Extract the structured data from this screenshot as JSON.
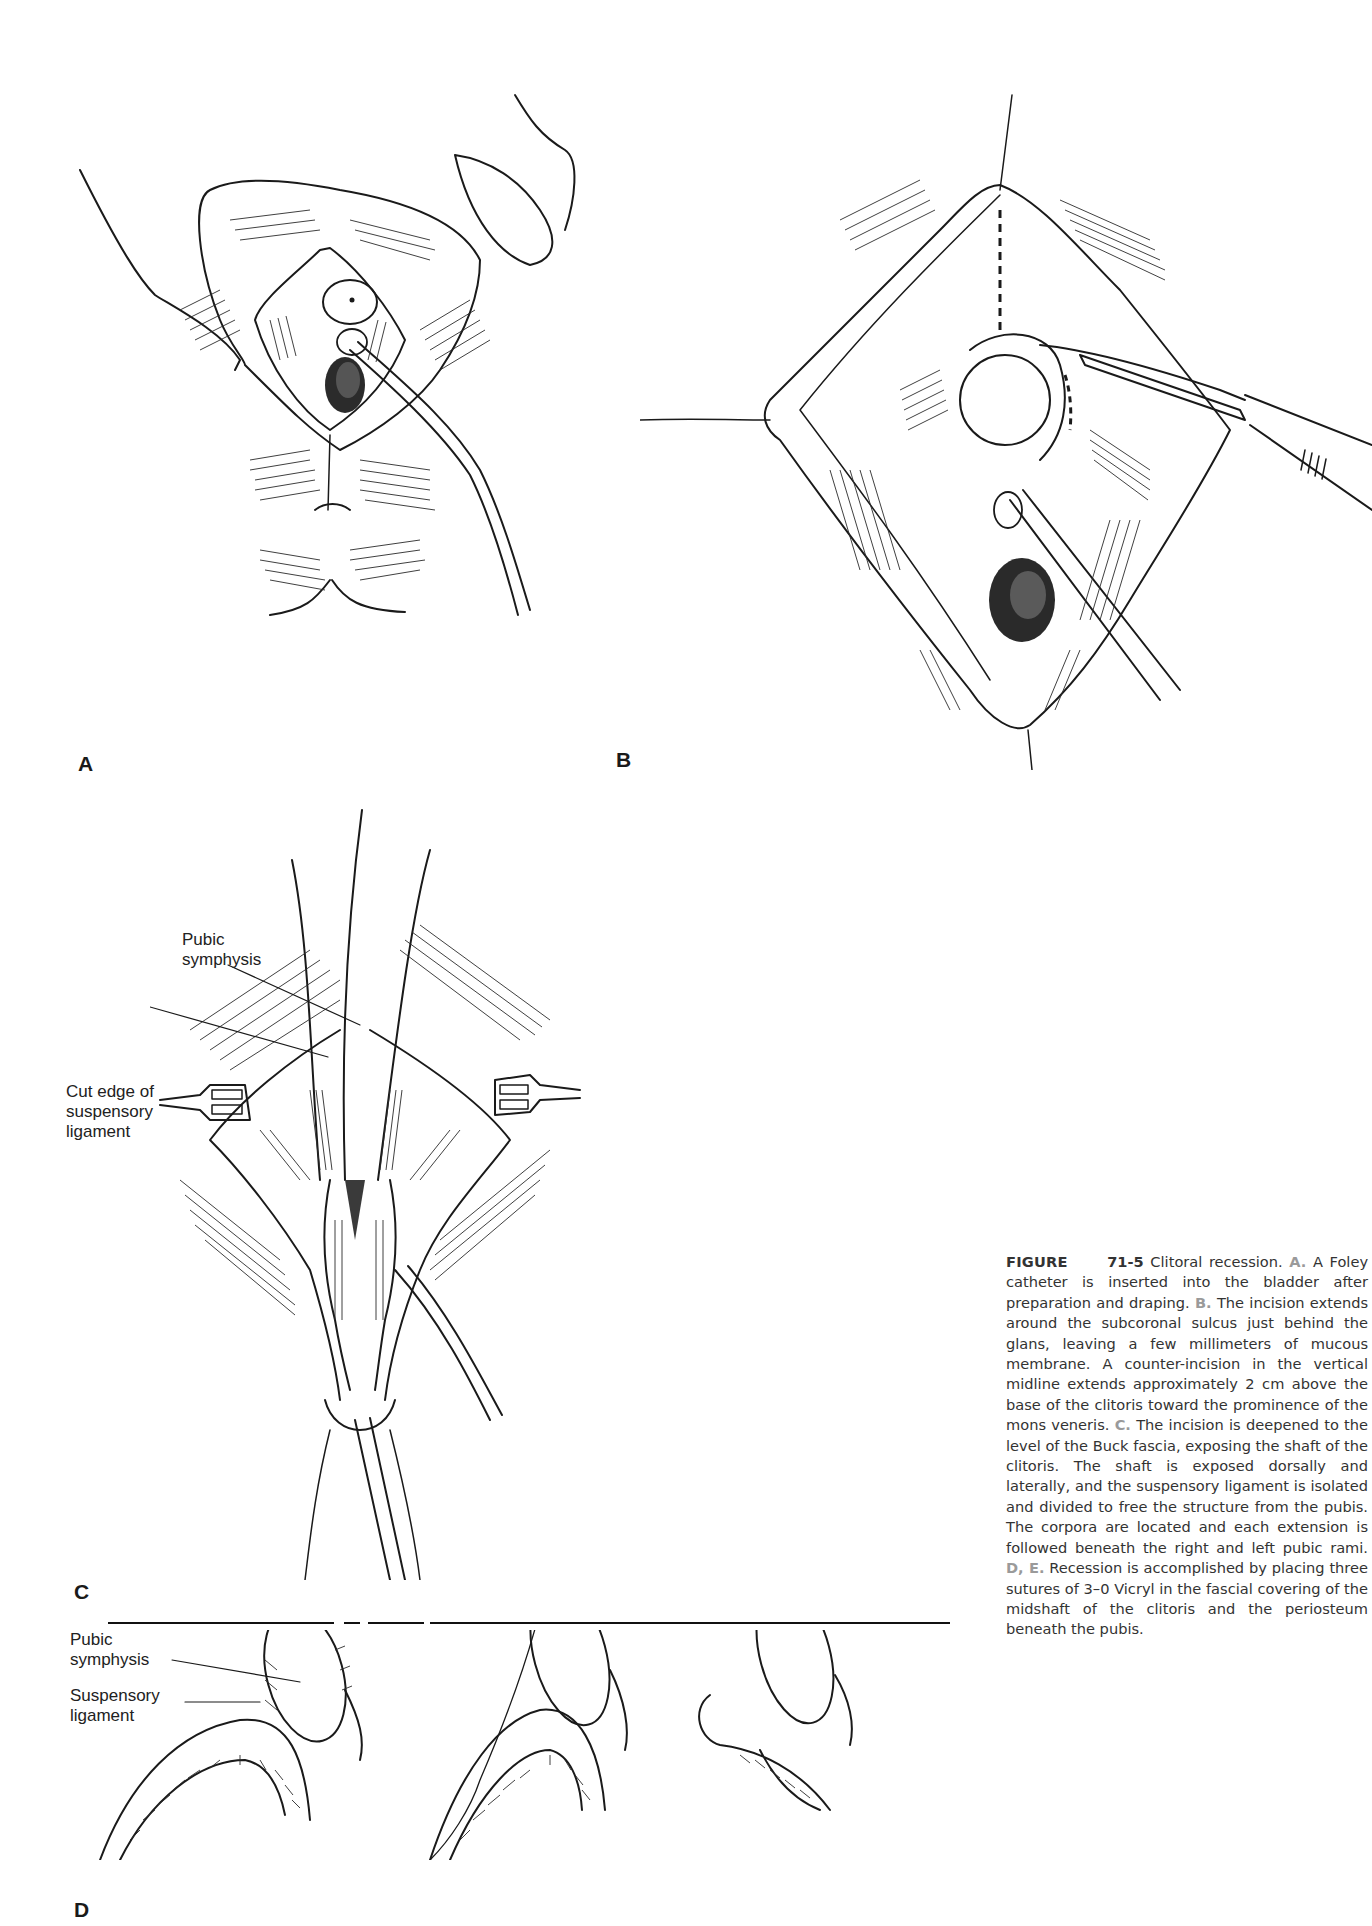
{
  "figure": {
    "number": "71-5",
    "title_word": "FIGURE",
    "short_title": "Clitoral recession.",
    "panels": [
      {
        "id": "A",
        "letter": "A"
      },
      {
        "id": "B",
        "letter": "B"
      },
      {
        "id": "C",
        "letter": "C"
      },
      {
        "id": "D",
        "letter": "D"
      }
    ],
    "labels": {
      "c_pubic_symphysis": "Pubic\nsymphysis",
      "c_cut_edge": "Cut edge of\nsuspensory\nligament",
      "d_pubic_symphysis": "Pubic\nsymphysis",
      "d_suspensory_ligament": "Suspensory\nligament"
    },
    "caption": {
      "a_ref": "A.",
      "a_text": "A Foley catheter is inserted into the bladder after preparation and draping.",
      "b_ref": "B.",
      "b_text": "The incision extends around the subcoronal sulcus just behind the glans, leaving a few millimeters of mucous membrane. A counter-incision in the vertical midline extends approximately 2 cm above the base of the clitoris toward the prominence of the mons veneris.",
      "c_ref": "C.",
      "c_text": "The incision is deepened to the level of the Buck fascia, exposing the shaft of the clitoris. The shaft is exposed dorsally and laterally, and the suspensory ligament is isolated and divided to free the structure from the pubis. The corpora are located and each extension is followed beneath the right and left pubic rami.",
      "de_ref": "D, E.",
      "de_text": "Recession is accomplished by placing three sutures of 3–0 Vicryl in the fascial covering of the midshaft of the clitoris and the periosteum beneath the pubis."
    },
    "colors": {
      "ink": "#1a1a1a",
      "caption_text": "#333333",
      "panel_ref": "#9a9a9a",
      "background": "#ffffff"
    }
  }
}
